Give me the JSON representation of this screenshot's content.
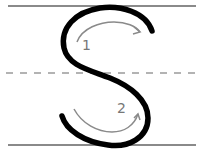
{
  "diagram": {
    "type": "letter-tracing-guide",
    "letter": "S",
    "stroke_labels": [
      "1",
      "2"
    ],
    "colors": {
      "letter_stroke": "#000000",
      "guide_lines": "#8a8a8a",
      "arrows": "#8a8a8a",
      "numbers": "#777777",
      "background": "#ffffff"
    }
  }
}
